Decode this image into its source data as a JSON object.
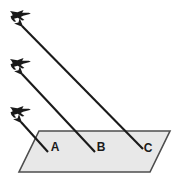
{
  "diagram": {
    "type": "geometry-line-of-sight",
    "colors": {
      "background": "#ffffff",
      "plane_fill": "#e8e8e8",
      "plane_stroke": "#4d4d4d",
      "arrow_stroke": "#1a1a1a",
      "aircraft_fill": "#1a1a1a",
      "label_color": "#1a1a1a"
    },
    "ground_plane": {
      "name": "ground-plane",
      "shape": "parallelogram",
      "points": "39,131 170,131 150,172 19,172",
      "fill": "#e8e8e8",
      "stroke": "#4d4d4d"
    },
    "labels": [
      {
        "id": "A",
        "text": "A",
        "x": 55,
        "y": 151
      },
      {
        "id": "B",
        "text": "B",
        "x": 101,
        "y": 151
      },
      {
        "id": "C",
        "text": "C",
        "x": 148,
        "y": 152
      }
    ],
    "sight_lines": [
      {
        "id": "line-a",
        "from_label": "A",
        "from": {
          "x": 48,
          "y": 152
        },
        "to": {
          "x": 21,
          "y": 122
        },
        "arrowhead": "at-aircraft"
      },
      {
        "id": "line-b",
        "from_label": "B",
        "from": {
          "x": 95,
          "y": 152
        },
        "to": {
          "x": 22,
          "y": 74
        },
        "arrowhead": "at-aircraft"
      },
      {
        "id": "line-c",
        "from_label": "C",
        "from": {
          "x": 143,
          "y": 149
        },
        "to": {
          "x": 22,
          "y": 26
        },
        "arrowhead": "at-aircraft"
      }
    ],
    "aircraft": [
      {
        "id": "aircraft-top",
        "label": "aircraft-top",
        "x": 20,
        "y": 18,
        "heading": "up-left"
      },
      {
        "id": "aircraft-middle",
        "label": "aircraft-middle",
        "x": 20,
        "y": 66,
        "heading": "up-left"
      },
      {
        "id": "aircraft-bottom",
        "label": "aircraft-bottom",
        "x": 20,
        "y": 114,
        "heading": "up-left"
      }
    ]
  }
}
